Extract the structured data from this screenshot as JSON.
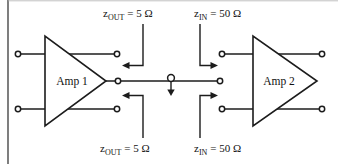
{
  "figure": {
    "type": "two-stage amplifier impedance matching schematic",
    "amps": [
      {
        "label": "Amp 1"
      },
      {
        "label": "Amp 2"
      }
    ],
    "labels": {
      "top_left": {
        "base": "z",
        "sub": "OUT",
        "value": "= 5 Ω"
      },
      "top_right": {
        "base": "z",
        "sub": "IN",
        "value": "= 50 Ω"
      },
      "bottom_left": {
        "base": "z",
        "sub": "OUT",
        "value": "= 5 Ω"
      },
      "bottom_right": {
        "base": "z",
        "sub": "IN",
        "value": "= 50 Ω"
      }
    },
    "values": {
      "amp1_output_impedance_ohms": 5,
      "amp2_input_impedance_ohms": 50
    },
    "colors": {
      "line": "#1c1c1c",
      "background": "#ffffff",
      "frame": "#3a3a3a",
      "top_hairline": "#b0b0b0"
    }
  }
}
